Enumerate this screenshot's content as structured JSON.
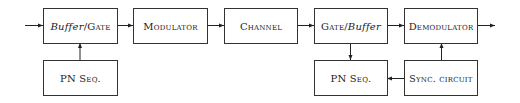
{
  "diagram": {
    "type": "block-diagram",
    "blocks": {
      "buffer_gate": {
        "part1": "Buffer",
        "sep": "/",
        "part2": "Gate"
      },
      "pn_seq_tx": {
        "label": "PN Seq."
      },
      "modulator": {
        "label": "Modulator"
      },
      "channel": {
        "label": "Channel"
      },
      "gate_buffer": {
        "part1": "Gate",
        "sep": "/",
        "part2": "Buffer"
      },
      "demodulator": {
        "label": "Demodulator"
      },
      "pn_seq_rx": {
        "label": "PN Seq."
      },
      "sync_circuit": {
        "label": "Sync. circuit"
      }
    },
    "connections": [
      {
        "from": "input",
        "to": "buffer_gate"
      },
      {
        "from": "pn_seq_tx",
        "to": "buffer_gate"
      },
      {
        "from": "buffer_gate",
        "to": "modulator"
      },
      {
        "from": "modulator",
        "to": "channel"
      },
      {
        "from": "channel",
        "to": "gate_buffer"
      },
      {
        "from": "gate_buffer",
        "to": "demodulator"
      },
      {
        "from": "gate_buffer",
        "to": "pn_seq_rx"
      },
      {
        "from": "sync_circuit",
        "to": "pn_seq_rx"
      },
      {
        "from": "sync_circuit",
        "to": "demodulator"
      },
      {
        "from": "demodulator",
        "to": "output"
      }
    ]
  }
}
